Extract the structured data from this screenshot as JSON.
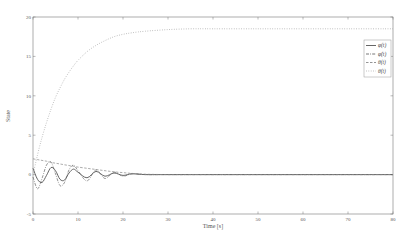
{
  "chart_data": {
    "type": "line",
    "title": "",
    "xlabel": "Time [s]",
    "ylabel": "State",
    "xlim": [
      0,
      80
    ],
    "ylim": [
      -5,
      20
    ],
    "xticks": [
      0,
      10,
      20,
      30,
      40,
      50,
      60,
      70,
      80
    ],
    "yticks": [
      -5,
      0,
      5,
      10,
      15,
      20
    ],
    "grid": false,
    "legend_position": "upper right",
    "x": [
      0,
      1,
      2,
      3,
      4,
      5,
      6,
      7,
      8,
      9,
      10,
      12,
      14,
      16,
      18,
      20,
      22,
      25,
      30,
      35,
      40,
      50,
      60,
      70,
      80
    ],
    "series": [
      {
        "name": "φ(t)",
        "style": "solid",
        "color": "#555555",
        "values": [
          0.8,
          -0.6,
          -1.0,
          -0.1,
          0.9,
          0.5,
          -0.6,
          -0.7,
          0.2,
          0.7,
          0.3,
          -0.4,
          0.4,
          -0.2,
          0.2,
          -0.1,
          0.1,
          0.0,
          0.0,
          0.0,
          0.0,
          0.0,
          0.0,
          0.0,
          0.0
        ]
      },
      {
        "name": "φ̇(t)",
        "style": "dashdot",
        "color": "#666666",
        "values": [
          -0.3,
          -1.8,
          -0.5,
          1.2,
          1.6,
          0.1,
          -1.4,
          -1.0,
          0.6,
          1.2,
          0.5,
          -0.8,
          0.6,
          -0.5,
          0.3,
          -0.2,
          0.1,
          0.0,
          0.0,
          0.0,
          0.0,
          0.0,
          0.0,
          0.0,
          0.0
        ]
      },
      {
        "name": "θ(t)",
        "style": "dashed",
        "color": "#888888",
        "values": [
          2.0,
          1.9,
          1.8,
          1.7,
          1.55,
          1.45,
          1.35,
          1.25,
          1.15,
          1.05,
          0.95,
          0.8,
          0.65,
          0.5,
          0.35,
          0.25,
          0.15,
          0.05,
          0.0,
          0.0,
          0.0,
          0.0,
          0.0,
          0.0,
          0.0
        ]
      },
      {
        "name": "θ̇(t)",
        "style": "dotted",
        "color": "#aaaaaa",
        "values": [
          0.0,
          2.5,
          4.7,
          6.6,
          8.3,
          9.8,
          11.0,
          12.1,
          13.0,
          13.8,
          14.5,
          15.6,
          16.4,
          17.0,
          17.5,
          17.8,
          18.0,
          18.2,
          18.4,
          18.5,
          18.5,
          18.5,
          18.5,
          18.5,
          18.5
        ]
      }
    ]
  }
}
